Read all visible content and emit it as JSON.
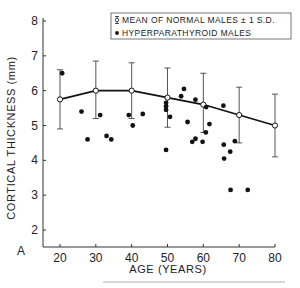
{
  "chart_data": {
    "type": "scatter",
    "panel_label": "A",
    "title": "",
    "xlabel": "AGE (YEARS)",
    "ylabel": "CORTICAL THICKNESS (mm)",
    "xlim": [
      15,
      80
    ],
    "ylim": [
      1.5,
      8
    ],
    "x_ticks": [
      20,
      30,
      40,
      50,
      60,
      70,
      80
    ],
    "y_ticks": [
      2,
      3,
      4,
      5,
      6,
      7,
      8
    ],
    "grid": false,
    "legend_position": "top-right",
    "legend": [
      {
        "label": "MEAN OF NORMAL MALES ± 1 S.D.",
        "marker": "open-circle-with-errorbar"
      },
      {
        "label": "HYPERPARATHYROID MALES",
        "marker": "filled-circle"
      }
    ],
    "series": [
      {
        "name": "MEAN OF NORMAL MALES ± 1 S.D.",
        "type": "line-errorbar",
        "x": [
          20,
          30,
          40,
          50,
          60,
          70,
          80
        ],
        "y": [
          5.75,
          6.0,
          6.0,
          5.8,
          5.6,
          5.3,
          5.0
        ],
        "y_lower": [
          4.9,
          5.2,
          5.2,
          4.95,
          4.8,
          4.5,
          4.1
        ],
        "y_upper": [
          6.6,
          6.85,
          6.8,
          6.65,
          6.5,
          6.1,
          5.9
        ]
      },
      {
        "name": "HYPERPARATHYROID MALES",
        "type": "scatter",
        "points": [
          [
            20.6,
            6.5
          ],
          [
            26.0,
            5.4
          ],
          [
            27.7,
            4.6
          ],
          [
            31.2,
            5.3
          ],
          [
            33.0,
            4.7
          ],
          [
            34.3,
            4.6
          ],
          [
            39.2,
            5.3
          ],
          [
            40.3,
            5.0
          ],
          [
            43.1,
            5.33
          ],
          [
            49.6,
            5.65
          ],
          [
            49.6,
            5.55
          ],
          [
            49.6,
            5.45
          ],
          [
            49.6,
            4.3
          ],
          [
            50.7,
            5.25
          ],
          [
            53.8,
            5.84
          ],
          [
            54.6,
            6.05
          ],
          [
            55.6,
            5.1
          ],
          [
            56.9,
            4.53
          ],
          [
            57.8,
            5.74
          ],
          [
            57.8,
            4.62
          ],
          [
            59.8,
            4.53
          ],
          [
            60.7,
            4.8
          ],
          [
            60.8,
            5.53
          ],
          [
            61.7,
            5.04
          ],
          [
            65.6,
            5.57
          ],
          [
            65.7,
            4.45
          ],
          [
            65.8,
            4.05
          ],
          [
            67.5,
            4.25
          ],
          [
            68.8,
            4.55
          ],
          [
            67.6,
            3.15
          ],
          [
            72.4,
            3.15
          ]
        ]
      }
    ]
  }
}
